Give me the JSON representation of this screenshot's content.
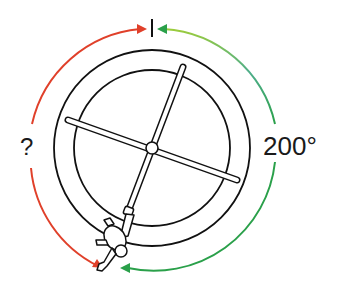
{
  "diagram": {
    "unknown_angle_label": "?",
    "known_angle_label": "200°",
    "colors": {
      "unknown_arc": "#e0402a",
      "known_arc_start": "#2aa04a",
      "known_arc_end": "#9ccc3c",
      "outline": "#111111",
      "background": "#ffffff"
    },
    "elements": {
      "outer_ring": "outer circle",
      "inner_ring": "inner circle",
      "bar_1": "long bar from upper-right to lower-left",
      "bar_2": "bar from left to right, tilted",
      "hub": "center pivot",
      "figure": "person hanging from lower end of bar",
      "reference_mark": "vertical tick at top"
    }
  }
}
